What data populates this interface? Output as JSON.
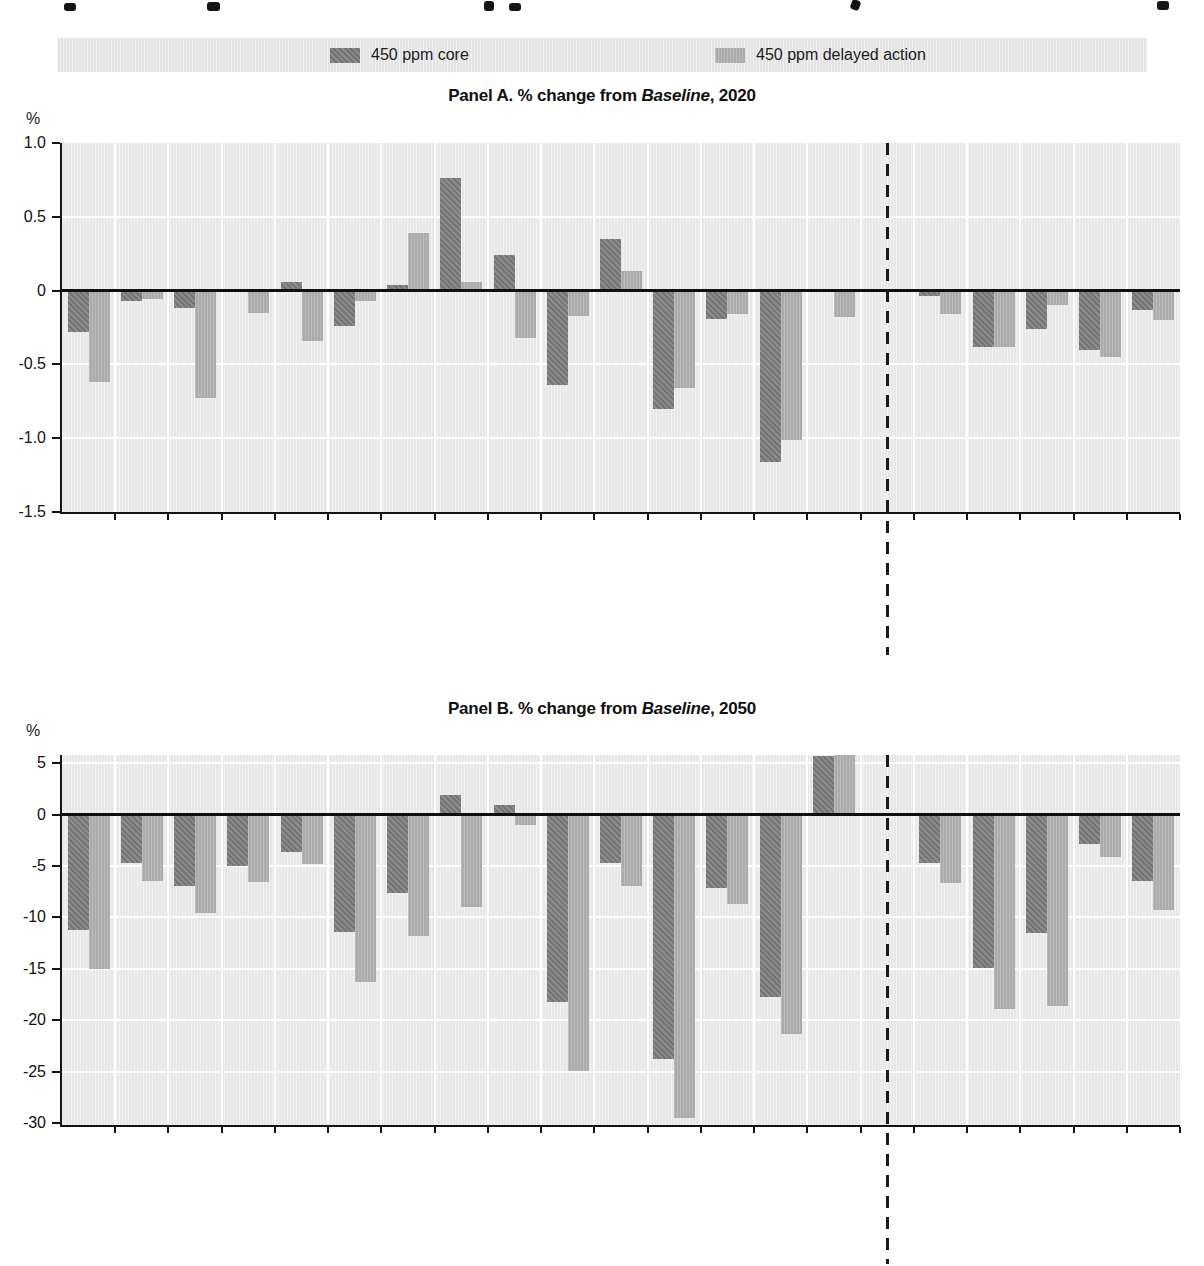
{
  "page": {
    "background": "#ffffff"
  },
  "legend": {
    "background": "#e3e3e3",
    "items": [
      {
        "label": "450 ppm core",
        "color": "#828282"
      },
      {
        "label": "450 ppm delayed action",
        "color": "#ababab"
      }
    ]
  },
  "chart_data": [
    {
      "type": "bar",
      "panel": "A",
      "title_prefix": "Panel A. % change from ",
      "title_italic": "Baseline",
      "title_suffix": ", 2020",
      "ylabel": "%",
      "ylim": [
        -1.5,
        1.0
      ],
      "yticks": [
        1.0,
        0.5,
        0,
        -0.5,
        -1.0,
        -1.5
      ],
      "ytick_labels": [
        "1.0",
        "0.5",
        "0",
        "-0.5",
        "-1.0",
        "-1.5"
      ],
      "grid": true,
      "legend_position": "top",
      "categories": [
        "Canada",
        "United States",
        "Oceania",
        "EU27 and EFTA",
        "Japan and Korea",
        "Brazil",
        "South Africa",
        "India",
        "Indonesia",
        "China",
        "Rest of Annex I",
        "Russia",
        "Mexico",
        "Middle East\nand North Africa",
        "Other countries",
        "OECD AI",
        "Russia\nand rest of AI",
        "Rest of BRIICS",
        "Rest of the world",
        "World"
      ],
      "divider_after_index": 14,
      "series": [
        {
          "name": "450 ppm core",
          "color": "#828282",
          "values": [
            -0.28,
            -0.07,
            -0.12,
            -0.01,
            0.06,
            -0.24,
            0.04,
            0.76,
            0.24,
            -0.64,
            0.35,
            -0.8,
            -0.19,
            -1.16,
            -0.01,
            -0.04,
            -0.38,
            -0.26,
            -0.4,
            -0.13
          ]
        },
        {
          "name": "450 ppm delayed action",
          "color": "#ababab",
          "values": [
            -0.62,
            -0.06,
            -0.73,
            -0.15,
            -0.34,
            -0.07,
            0.39,
            0.06,
            -0.32,
            -0.17,
            0.13,
            -0.66,
            -0.16,
            -1.01,
            -0.18,
            -0.16,
            -0.38,
            -0.1,
            -0.45,
            -0.2
          ]
        }
      ]
    },
    {
      "type": "bar",
      "panel": "B",
      "title_prefix": "Panel B. % change from ",
      "title_italic": "Baseline",
      "title_suffix": ", 2050",
      "ylabel": "%",
      "ylim": [
        -30.2,
        5.8
      ],
      "yticks": [
        5,
        0,
        -5,
        -10,
        -15,
        -20,
        -25,
        -30
      ],
      "ytick_labels": [
        "5",
        "0",
        "-5",
        "-10",
        "-15",
        "-20",
        "-25",
        "-30"
      ],
      "grid": true,
      "legend_position": "top",
      "categories": [
        "Canada",
        "United States",
        "Oceania",
        "EU27 and EFTA",
        "Japan and Korea",
        "Brazil",
        "South Africa",
        "India",
        "Indonesia",
        "China",
        "Rest of Annex I",
        "Russia",
        "Mexico",
        "Middle East\nand North Africa",
        "Other countries",
        "OECD AI",
        "Russia\nand rest of AI",
        "Rest of BRIICS",
        "Rest of the world",
        "World"
      ],
      "divider_after_index": 14,
      "series": [
        {
          "name": "450 ppm core",
          "color": "#828282",
          "values": [
            -11.2,
            -4.7,
            -6.9,
            -5.0,
            -3.6,
            -11.4,
            -7.6,
            1.9,
            0.9,
            -18.2,
            -4.7,
            -23.8,
            -7.1,
            -17.7,
            5.7,
            -4.7,
            -14.9,
            -11.5,
            -2.9,
            -6.5
          ]
        },
        {
          "name": "450 ppm delayed action",
          "color": "#ababab",
          "values": [
            -15.0,
            -6.5,
            -9.6,
            -6.6,
            -4.8,
            -16.3,
            -11.8,
            -9.0,
            -1.0,
            -24.9,
            -6.9,
            -29.5,
            -8.7,
            -21.3,
            5.8,
            -6.7,
            -18.9,
            -18.6,
            -4.1,
            -9.3
          ]
        }
      ]
    }
  ]
}
